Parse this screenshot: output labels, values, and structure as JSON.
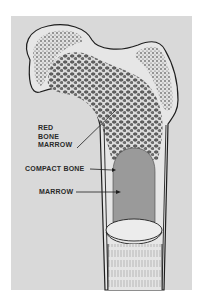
{
  "figure": {
    "labels": {
      "red_bone_marrow": [
        "RED",
        "BONE",
        "MARROW"
      ],
      "compact_bone": "COMPACT BONE",
      "marrow": "MARROW"
    }
  },
  "colors": {
    "background": "#ffffff",
    "panel": "#d9d9d9",
    "outline": "#1e1e1e",
    "spongy_bone": "#6e6e6e",
    "marrow_cavity": "#9a9a9a",
    "bone_light": "#e6e6e6"
  }
}
